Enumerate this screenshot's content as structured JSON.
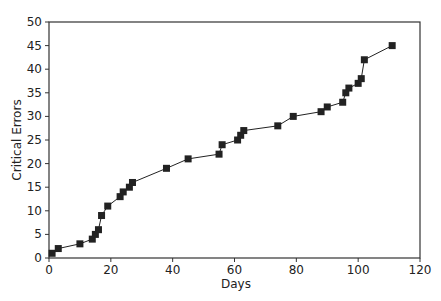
{
  "chart_data": {
    "type": "line",
    "title": "",
    "xlabel": "Days",
    "ylabel": "Critical Errors",
    "xlim": [
      0,
      120
    ],
    "ylim": [
      0,
      50
    ],
    "xticks": [
      0,
      20,
      40,
      60,
      80,
      100,
      120
    ],
    "yticks": [
      0,
      5,
      10,
      15,
      20,
      25,
      30,
      35,
      40,
      45,
      50
    ],
    "grid": false,
    "legend": null,
    "marker": "square",
    "series": [
      {
        "name": "Critical Errors",
        "color": "#222222",
        "x": [
          1,
          3,
          10,
          14,
          15,
          16,
          17,
          19,
          23,
          24,
          26,
          27,
          38,
          45,
          55,
          56,
          61,
          62,
          63,
          74,
          79,
          88,
          90,
          95,
          96,
          97,
          100,
          101,
          102,
          111
        ],
        "y": [
          1,
          2,
          3,
          4,
          5,
          6,
          9,
          11,
          13,
          14,
          15,
          16,
          19,
          21,
          22,
          24,
          25,
          26,
          27,
          28,
          30,
          31,
          32,
          33,
          35,
          36,
          37,
          38,
          42,
          45
        ]
      }
    ]
  }
}
